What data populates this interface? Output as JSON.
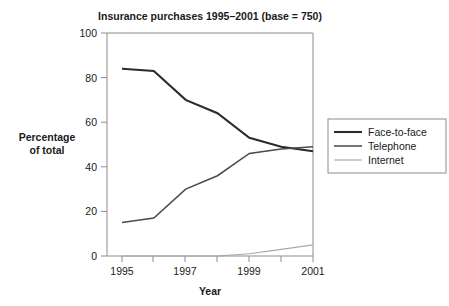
{
  "chart_data": {
    "type": "line",
    "title": "Insurance purchases 1995–2001 (base = 750)",
    "xlabel": "Year",
    "ylabel": "Percentage of total",
    "ylabel_lines": [
      "Percentage",
      "of total"
    ],
    "x": [
      1995,
      1996,
      1997,
      1998,
      1999,
      2000,
      2001
    ],
    "categories": [
      "1995",
      "1996",
      "1997",
      "1998",
      "1999",
      "2000",
      "2001"
    ],
    "xtick_labels": [
      "1995",
      "",
      "1997",
      "",
      "1999",
      "",
      "2001"
    ],
    "ytick_labels": [
      "0",
      "20",
      "40",
      "60",
      "80",
      "100"
    ],
    "yticks": [
      0,
      20,
      40,
      60,
      80,
      100
    ],
    "xlim": [
      1995,
      2001
    ],
    "ylim": [
      0,
      100
    ],
    "grid": false,
    "legend_position": "right",
    "series": [
      {
        "name": "Face-to-face",
        "values": [
          84,
          83,
          70,
          64,
          53,
          49,
          47
        ],
        "color": "#2b2b2b",
        "width": 2.1
      },
      {
        "name": "Telephone",
        "values": [
          15,
          17,
          30,
          36,
          46,
          48,
          49
        ],
        "color": "#4a4a4a",
        "width": 1.5
      },
      {
        "name": "Internet",
        "values": [
          0,
          0,
          0,
          0,
          1,
          3,
          5
        ],
        "color": "#a8a8a8",
        "width": 1.2
      }
    ]
  },
  "legend": {
    "entries": [
      "Face-to-face",
      "Telephone",
      "Internet"
    ]
  },
  "colors": {
    "background": "#ffffff",
    "axis": "#8c8c8c",
    "text": "#1a1a1a",
    "face_to_face": "#2b2b2b",
    "telephone": "#4a4a4a",
    "internet": "#a8a8a8"
  }
}
